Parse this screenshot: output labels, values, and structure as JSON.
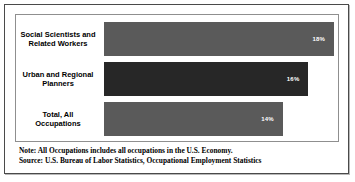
{
  "chart_data": {
    "type": "bar",
    "orientation": "horizontal",
    "title": "",
    "xlabel": "",
    "ylabel": "",
    "grid": false,
    "legend": null,
    "xlim": [
      0,
      18
    ],
    "categories": [
      "Social Scientists and Related Workers",
      "Urban and Regional Planners",
      "Total, All Occupations"
    ],
    "values": [
      18,
      16,
      14
    ],
    "value_labels": [
      "18%",
      "16%",
      "14%"
    ],
    "bar_colors": [
      "#5a5a5a",
      "#272727",
      "#5a5a5a"
    ],
    "bars": [
      {
        "category_line1": "Social Scientists and",
        "category_line2": "Related Workers",
        "value": 18,
        "label": "18%",
        "color": "#5a5a5a"
      },
      {
        "category_line1": "Urban and Regional",
        "category_line2": "Planners",
        "value": 16,
        "label": "16%",
        "color": "#272727"
      },
      {
        "category_line1": "Total, All",
        "category_line2": "Occupations",
        "value": 14,
        "label": "14%",
        "color": "#5a5a5a"
      }
    ]
  },
  "notes": {
    "note": "Note: All Occupations includes all occupations in the U.S. Economy.",
    "source": "Source: U.S. Bureau of Labor Statistics, Occupational Employment Statistics"
  }
}
